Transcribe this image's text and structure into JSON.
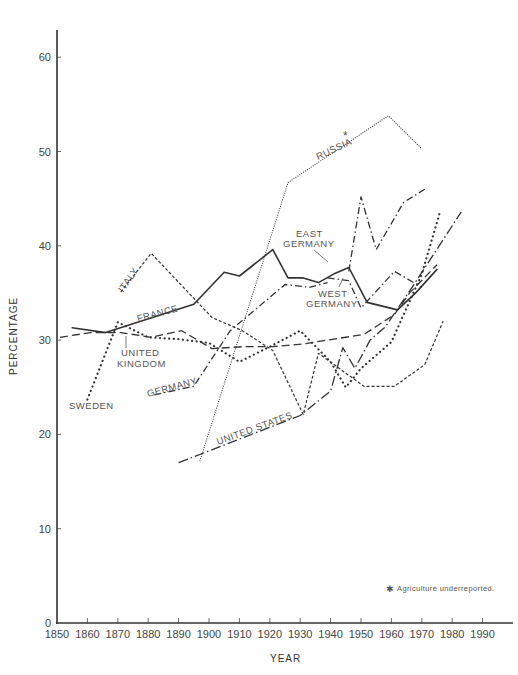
{
  "chart_data": {
    "type": "line",
    "title": "",
    "xlabel": "YEAR",
    "ylabel": "PERCENTAGE",
    "xlim": [
      1850,
      1990
    ],
    "ylim": [
      0,
      63
    ],
    "grid": false,
    "x_ticks": [
      1850,
      1860,
      1870,
      1880,
      1890,
      1900,
      1910,
      1920,
      1930,
      1940,
      1950,
      1960,
      1970,
      1980,
      1990
    ],
    "y_ticks": [
      0,
      10,
      20,
      30,
      40,
      50,
      60
    ],
    "footnote": "* Agriculture underreported.",
    "series": [
      {
        "name": "FRANCE",
        "style": "solid",
        "points": [
          [
            1855,
            31.3
          ],
          [
            1866,
            30.8
          ],
          [
            1895,
            33.8
          ],
          [
            1900,
            35.5
          ],
          [
            1905,
            37.2
          ],
          [
            1910,
            36.8
          ],
          [
            1921,
            39.6
          ],
          [
            1926,
            36.6
          ],
          [
            1931,
            36.6
          ],
          [
            1936,
            36.1
          ],
          [
            1941,
            37.0
          ],
          [
            1946,
            37.7
          ],
          [
            1952,
            34.0
          ],
          [
            1962,
            33.2
          ],
          [
            1968,
            35.0
          ],
          [
            1975,
            37.5
          ]
        ]
      },
      {
        "name": "ITALY",
        "style": "short-dash",
        "points": [
          [
            1871,
            35.1
          ],
          [
            1881,
            39.2
          ],
          [
            1901,
            32.4
          ],
          [
            1911,
            31.0
          ],
          [
            1921,
            28.9
          ],
          [
            1931,
            22.1
          ],
          [
            1936,
            28.6
          ],
          [
            1951,
            25.1
          ],
          [
            1961,
            25.1
          ],
          [
            1971,
            27.4
          ],
          [
            1977,
            32.0
          ]
        ]
      },
      {
        "name": "UNITED KINGDOM",
        "style": "long-dash",
        "points": [
          [
            1851,
            30.3
          ],
          [
            1861,
            30.8
          ],
          [
            1871,
            30.8
          ],
          [
            1881,
            30.3
          ],
          [
            1891,
            31.0
          ],
          [
            1901,
            29.1
          ],
          [
            1911,
            29.3
          ],
          [
            1921,
            29.3
          ],
          [
            1931,
            29.6
          ],
          [
            1951,
            30.6
          ],
          [
            1961,
            32.7
          ],
          [
            1966,
            35.0
          ],
          [
            1975,
            38.0
          ]
        ]
      },
      {
        "name": "SWEDEN",
        "style": "heavy-dot",
        "points": [
          [
            1860,
            23.7
          ],
          [
            1870,
            31.9
          ],
          [
            1880,
            30.3
          ],
          [
            1890,
            30.1
          ],
          [
            1900,
            29.7
          ],
          [
            1910,
            27.7
          ],
          [
            1920,
            29.3
          ],
          [
            1930,
            31.0
          ],
          [
            1940,
            27.7
          ],
          [
            1945,
            25.0
          ],
          [
            1950,
            27.0
          ],
          [
            1960,
            29.8
          ],
          [
            1970,
            37.0
          ],
          [
            1976,
            43.6
          ]
        ]
      },
      {
        "name": "GERMANY",
        "style": "dash-dot",
        "points": [
          [
            1882,
            24.2
          ],
          [
            1895,
            25.1
          ],
          [
            1907,
            31.0
          ],
          [
            1925,
            35.9
          ],
          [
            1933,
            35.6
          ],
          [
            1939,
            36.1
          ]
        ]
      },
      {
        "name": "WEST GERMANY",
        "style": "dash-dot",
        "points": [
          [
            1939,
            36.6
          ],
          [
            1946,
            36.3
          ],
          [
            1950,
            33.4
          ],
          [
            1961,
            37.3
          ],
          [
            1970,
            35.6
          ]
        ]
      },
      {
        "name": "EAST GERMANY",
        "style": "dash-dot",
        "points": [
          [
            1946,
            37.3
          ],
          [
            1950,
            45.2
          ],
          [
            1955,
            39.6
          ],
          [
            1964,
            44.6
          ],
          [
            1971,
            46.0
          ]
        ]
      },
      {
        "name": "RUSSIA*",
        "style": "fine-dot",
        "points": [
          [
            1897,
            17.2
          ],
          [
            1926,
            46.7
          ],
          [
            1959,
            53.8
          ],
          [
            1970,
            50.3
          ]
        ]
      },
      {
        "name": "UNITED STATES",
        "style": "dash-dot-long",
        "points": [
          [
            1890,
            17.0
          ],
          [
            1930,
            22.0
          ],
          [
            1940,
            24.6
          ],
          [
            1944,
            29.2
          ],
          [
            1948,
            27.0
          ],
          [
            1953,
            30.0
          ],
          [
            1958,
            31.4
          ],
          [
            1966,
            35.2
          ],
          [
            1983,
            43.6
          ]
        ]
      }
    ]
  },
  "labels": {
    "italy": "ITALY",
    "france": "FRANCE",
    "uk_line1": "UNITED",
    "uk_line2": "KINGDOM",
    "sweden": "SWEDEN",
    "germany": "GERMANY",
    "united_states": "UNITED STATES",
    "russia": "RUSSIA",
    "east_germany_line1": "EAST",
    "east_germany_line2": "GERMANY",
    "west_germany_line1": "WEST",
    "west_germany_line2": "GERMANY",
    "asterisk": "*"
  },
  "axes": {
    "xlabel": "YEAR",
    "ylabel": "PERCENTAGE",
    "footnote": "Agriculture underreported.",
    "footnote_mark": "✱"
  }
}
